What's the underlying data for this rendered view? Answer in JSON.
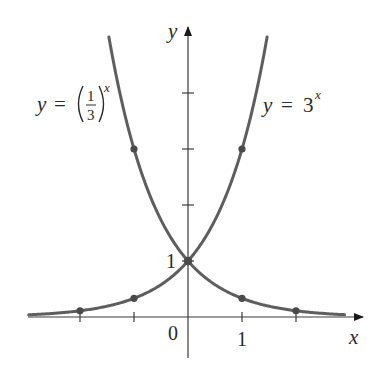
{
  "chart_data": {
    "type": "line",
    "title": "",
    "xlabel": "x",
    "ylabel": "y",
    "xlim": [
      -2.95,
      3.2
    ],
    "ylim": [
      -0.75,
      5.3
    ],
    "grid": false,
    "legend": null,
    "x_ticks": [
      -2,
      -1,
      0,
      1,
      2
    ],
    "x_tick_labels": [
      {
        "value": 0,
        "label": "0"
      },
      {
        "value": 1,
        "label": "1"
      }
    ],
    "y_ticks": [
      1,
      2,
      3,
      4
    ],
    "y_tick_labels": [
      {
        "value": 1,
        "label": "1"
      }
    ],
    "series": [
      {
        "name": "y = (1/3)^x",
        "function": "(1/3)^x",
        "x_range": [
          -1.465,
          2.9
        ],
        "highlighted_points": [
          {
            "x": -1,
            "y": 3
          },
          {
            "x": 0,
            "y": 1
          },
          {
            "x": 1,
            "y": 0.3333
          },
          {
            "x": 2,
            "y": 0.1111
          }
        ]
      },
      {
        "name": "y = 3^x",
        "function": "3^x",
        "x_range": [
          -2.95,
          1.465
        ],
        "highlighted_points": [
          {
            "x": -2,
            "y": 0.1111
          },
          {
            "x": -1,
            "y": 0.3333
          },
          {
            "x": 0,
            "y": 1
          },
          {
            "x": 1,
            "y": 3
          }
        ]
      }
    ],
    "annotations": [
      {
        "text": "y = (1/3)^x",
        "position": "upper-left, beside left curve"
      },
      {
        "text": "y = 3^x",
        "position": "upper-right, beside right curve"
      }
    ]
  },
  "labels": {
    "x_axis": "x",
    "y_axis": "y",
    "origin": "0",
    "x_one": "1",
    "y_one": "1",
    "left_curve": {
      "lhs": "y",
      "eq": "=",
      "num": "1",
      "den": "3",
      "exp": "x"
    },
    "right_curve": {
      "lhs": "y",
      "eq": "=",
      "base": "3",
      "exp": "x"
    }
  },
  "style": {
    "curve_color": "#5e5e5e",
    "point_color": "#4a4a4a",
    "axis_color": "#3a3a3a",
    "text_color": "#2a2a2a"
  },
  "layout": {
    "origin_px": [
      188,
      317
    ],
    "unit_x_px": 54,
    "unit_y_px": 56
  }
}
